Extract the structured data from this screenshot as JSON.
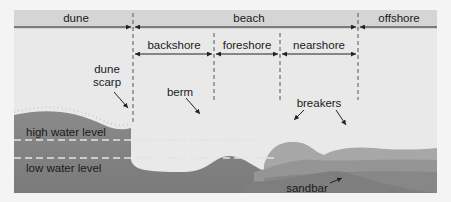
{
  "diagram": {
    "zones_top": [
      {
        "id": "dune",
        "label": "dune"
      },
      {
        "id": "beach",
        "label": "beach"
      },
      {
        "id": "offshore",
        "label": "offshore"
      }
    ],
    "zones_beach": [
      {
        "id": "backshore",
        "label": "backshore"
      },
      {
        "id": "foreshore",
        "label": "foreshore"
      },
      {
        "id": "nearshore",
        "label": "nearshore"
      }
    ],
    "annotations": {
      "dune_scarp_line1": "dune",
      "dune_scarp_line2": "scarp",
      "berm": "berm",
      "breakers": "breakers",
      "sandbar": "sandbar",
      "high_water": "high water level",
      "low_water": "low water level"
    },
    "colors": {
      "background": "#e9e9e9",
      "header": "#d5d5d5",
      "sand_dark": "#7a7a7a",
      "water_light": "#a9a9a9",
      "dashed_line": "#5a5a5a"
    }
  }
}
